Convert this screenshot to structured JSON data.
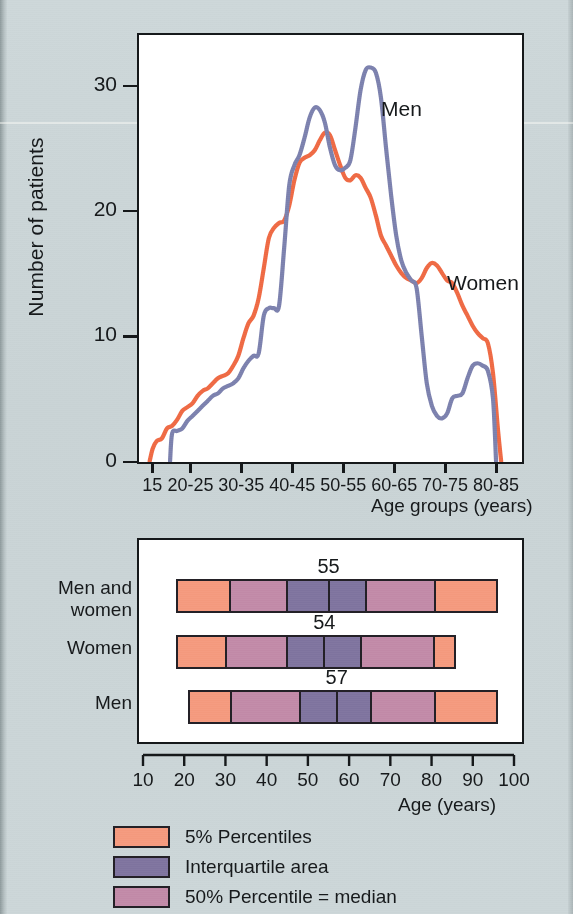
{
  "figure": {
    "background_color": "#ccd6d8",
    "ink_color": "#16191b"
  },
  "chart_data": [
    {
      "type": "line",
      "id": "age-distribution-curves",
      "title": "",
      "xlabel": "Age groups (years)",
      "ylabel": "Number of patients",
      "xlim": [
        12.5,
        87.5
      ],
      "ylim": [
        0,
        34
      ],
      "grid": false,
      "legend_position": "inline-annotation",
      "xtick_labels": [
        "15",
        "20-25",
        "30-35",
        "40-45",
        "50-55",
        "60-65",
        "70-75",
        "80-85"
      ],
      "xtick_values": [
        15,
        22.5,
        32.5,
        42.5,
        52.5,
        62.5,
        72.5,
        82.5
      ],
      "ytick_labels": [
        "0",
        "10",
        "20",
        "30"
      ],
      "ytick_values": [
        0,
        10,
        20,
        30
      ],
      "series": [
        {
          "name": "Women",
          "color": "#ef6a45",
          "x": [
            14.6,
            15.2,
            16.0,
            17.0,
            18.0,
            19.0,
            20.0,
            21.0,
            22.0,
            23.0,
            24.0,
            25.0,
            26.0,
            27.0,
            28.0,
            29.0,
            30.0,
            31.0,
            32.0,
            33.0,
            34.0,
            35.0,
            36.0,
            37.0,
            38.0,
            39.0,
            40.0,
            41.0,
            42.0,
            43.0,
            44.0,
            45.0,
            46.0,
            47.0,
            48.0,
            49.0,
            50.0,
            51.0,
            52.0,
            53.0,
            54.0,
            55.0,
            56.0,
            57.0,
            58.0,
            59.0,
            60.0,
            61.0,
            62.0,
            63.0,
            64.0,
            65.0,
            66.0,
            67.0,
            68.0,
            69.0,
            70.0,
            71.0,
            72.0,
            73.0,
            74.0,
            75.0,
            76.0,
            77.0,
            78.0,
            79.0,
            80.0,
            81.0,
            82.0,
            83.0,
            83.6
          ],
          "y": [
            0.0,
            1.0,
            1.6,
            1.8,
            2.6,
            2.8,
            3.3,
            4.0,
            4.3,
            4.6,
            5.2,
            5.6,
            5.8,
            6.2,
            6.6,
            6.8,
            7.0,
            7.6,
            8.4,
            9.8,
            11.0,
            11.6,
            13.0,
            15.4,
            17.8,
            18.6,
            19.0,
            19.2,
            20.4,
            22.4,
            23.8,
            24.2,
            24.4,
            24.8,
            25.6,
            26.2,
            26.0,
            24.8,
            23.6,
            22.6,
            22.4,
            22.8,
            22.6,
            21.8,
            21.0,
            19.6,
            18.0,
            17.2,
            16.4,
            15.6,
            15.0,
            14.6,
            14.4,
            14.2,
            14.6,
            15.4,
            15.8,
            15.6,
            15.0,
            14.4,
            14.2,
            13.4,
            12.4,
            11.6,
            10.8,
            10.2,
            9.8,
            9.4,
            7.0,
            2.4,
            0.0
          ]
        },
        {
          "name": "Men",
          "color": "#7c81ae",
          "x": [
            18.6,
            19.0,
            20.0,
            21.0,
            22.0,
            23.0,
            24.0,
            25.0,
            26.0,
            27.0,
            28.0,
            29.0,
            30.0,
            31.0,
            32.0,
            33.0,
            34.0,
            35.0,
            36.0,
            37.0,
            38.0,
            39.0,
            40.0,
            41.0,
            42.0,
            43.0,
            44.0,
            45.0,
            46.0,
            47.0,
            48.0,
            49.0,
            50.0,
            51.0,
            52.0,
            53.0,
            54.0,
            55.0,
            56.0,
            57.0,
            58.0,
            59.0,
            60.0,
            61.0,
            62.0,
            63.0,
            64.0,
            65.0,
            66.0,
            67.0,
            68.0,
            69.0,
            70.0,
            71.0,
            72.0,
            73.0,
            74.0,
            75.0,
            76.0,
            77.0,
            78.0,
            79.0,
            80.0,
            81.0,
            82.0,
            82.6
          ],
          "y": [
            0.0,
            2.2,
            2.4,
            2.6,
            3.2,
            3.6,
            4.0,
            4.4,
            4.8,
            5.2,
            5.4,
            5.8,
            6.0,
            6.2,
            6.6,
            7.4,
            8.0,
            8.4,
            8.6,
            11.6,
            12.2,
            12.2,
            12.4,
            17.0,
            22.0,
            23.6,
            24.4,
            25.8,
            27.4,
            28.2,
            28.0,
            27.0,
            25.0,
            23.6,
            23.2,
            23.4,
            24.0,
            26.6,
            29.6,
            31.2,
            31.4,
            31.0,
            29.0,
            25.0,
            21.2,
            18.0,
            16.0,
            15.0,
            14.4,
            13.8,
            10.0,
            6.2,
            4.4,
            3.6,
            3.4,
            3.8,
            5.0,
            5.2,
            5.4,
            6.6,
            7.6,
            7.8,
            7.6,
            7.2,
            5.0,
            0.0
          ]
        }
      ],
      "annotations": [
        {
          "label": "Men",
          "x_px": 381,
          "y_px": 97
        },
        {
          "label": "Women",
          "x_px": 447,
          "y_px": 271
        }
      ]
    },
    {
      "type": "bar",
      "id": "age-percentile-ranges",
      "title": "",
      "xlabel": "Age (years)",
      "ylabel": "",
      "xlim": [
        10,
        100
      ],
      "grid": false,
      "xtick_labels": [
        "10",
        "20",
        "30",
        "40",
        "50",
        "60",
        "70",
        "80",
        "90",
        "100"
      ],
      "xtick_values": [
        10,
        20,
        30,
        40,
        50,
        60,
        70,
        80,
        90,
        100
      ],
      "categories": [
        "Men and women",
        "Women",
        "Men"
      ],
      "rows": [
        {
          "label_line1": "Men and",
          "label_line2": "women",
          "median": "55",
          "median_value": 55,
          "p5": 18,
          "p25": 31,
          "median_x": 55,
          "p75": 64,
          "p95": 96,
          "lower_mid": 45,
          "upper_mid": 64,
          "segments": [
            {
              "from": 18,
              "to": 31,
              "kind": "percentile-5"
            },
            {
              "from": 31,
              "to": 45,
              "kind": "percentile-50"
            },
            {
              "from": 45,
              "to": 55,
              "kind": "interquartile"
            },
            {
              "from": 55,
              "to": 64,
              "kind": "interquartile"
            },
            {
              "from": 64,
              "to": 81,
              "kind": "percentile-50"
            },
            {
              "from": 81,
              "to": 96,
              "kind": "percentile-5"
            }
          ]
        },
        {
          "label_line1": "Women",
          "label_line2": "",
          "median": "54",
          "median_value": 54,
          "p5": 18,
          "p25": 30,
          "median_x": 54,
          "p75": 63,
          "p95": 86,
          "lower_mid": 45,
          "upper_mid": 63,
          "segments": [
            {
              "from": 18,
              "to": 30,
              "kind": "percentile-5"
            },
            {
              "from": 30,
              "to": 45,
              "kind": "percentile-50"
            },
            {
              "from": 45,
              "to": 54,
              "kind": "interquartile"
            },
            {
              "from": 54,
              "to": 63,
              "kind": "interquartile"
            },
            {
              "from": 63,
              "to": 81,
              "kind": "percentile-50"
            },
            {
              "from": 81,
              "to": 86,
              "kind": "percentile-5"
            }
          ]
        },
        {
          "label_line1": "Men",
          "label_line2": "",
          "median": "57",
          "median_value": 57,
          "p5": 21,
          "p25": 31,
          "median_x": 57,
          "p75": 65,
          "p95": 96,
          "lower_mid": 48,
          "upper_mid": 65,
          "segments": [
            {
              "from": 21,
              "to": 31,
              "kind": "percentile-5"
            },
            {
              "from": 31,
              "to": 48,
              "kind": "percentile-50"
            },
            {
              "from": 48,
              "to": 57,
              "kind": "interquartile"
            },
            {
              "from": 57,
              "to": 65,
              "kind": "interquartile"
            },
            {
              "from": 65,
              "to": 81,
              "kind": "percentile-50"
            },
            {
              "from": 81,
              "to": 96,
              "kind": "percentile-5"
            }
          ]
        }
      ]
    }
  ],
  "legend": {
    "items": [
      {
        "label": "5% Percentiles",
        "color": "#f59a7e",
        "kind": "percentile-5"
      },
      {
        "label": "Interquartile area",
        "color": "#7f749f",
        "kind": "interquartile"
      },
      {
        "label": "50% Percentile = median",
        "color": "#c28aa8",
        "kind": "percentile-50"
      }
    ]
  },
  "colors": {
    "percentile_5": "#f59a7e",
    "interquartile": "#7f749f",
    "percentile_50": "#c28aa8",
    "women_line": "#ef6a45",
    "men_line": "#7c81ae",
    "outline": "#232026",
    "background": "#ccd6d8"
  }
}
